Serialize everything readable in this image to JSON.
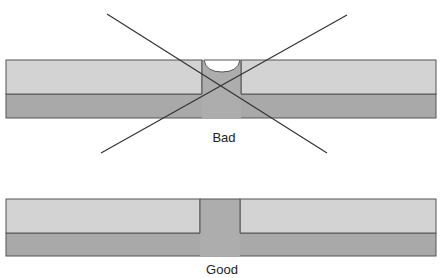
{
  "header": {
    "clipped_text": "g                                                           y"
  },
  "diagrams": [
    {
      "id": "bad",
      "label": "Bad",
      "has_void": true,
      "crossed_out": true
    },
    {
      "id": "good",
      "label": "Good",
      "has_void": false,
      "crossed_out": false
    }
  ],
  "colors": {
    "top_layer": "#d3d3d3",
    "bottom_layer": "#a9a9a9",
    "via_fill": "#adadad",
    "outline": "#555555",
    "cross_line": "#333333",
    "void": "#ffffff"
  }
}
